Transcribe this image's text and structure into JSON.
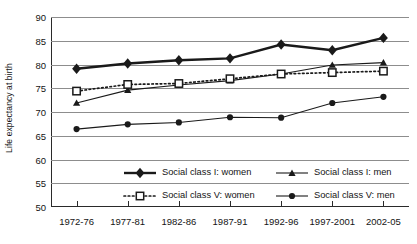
{
  "chart_data": {
    "type": "line",
    "title": "",
    "xlabel": "",
    "ylabel": "Life expectancy at birth",
    "categories": [
      "1972-76",
      "1977-81",
      "1982-86",
      "1987-91",
      "1992-96",
      "1997-2001",
      "2002-05"
    ],
    "ylim": [
      50,
      90
    ],
    "ytick_labels": [
      "90",
      "85",
      "80",
      "75",
      "70",
      "65",
      "60",
      "55",
      "50"
    ],
    "ytick_values": [
      90,
      85,
      80,
      75,
      70,
      65,
      60,
      55,
      50
    ],
    "grid": true,
    "legend_position": "inside-lower-center",
    "series": [
      {
        "name": "Social class I: women",
        "marker": "filled-diamond",
        "line": "solid-thick",
        "color": "#1a1a1a",
        "values": [
          79.1,
          80.2,
          80.9,
          81.3,
          84.2,
          83.0,
          85.6
        ]
      },
      {
        "name": "Social class I: men",
        "marker": "filled-triangle",
        "line": "solid-thin",
        "color": "#1a1a1a",
        "values": [
          71.9,
          74.6,
          75.7,
          76.6,
          78.0,
          79.9,
          80.4
        ]
      },
      {
        "name": "Social class V: women",
        "marker": "open-square",
        "line": "dotted",
        "color": "#1a1a1a",
        "values": [
          74.4,
          75.8,
          76.0,
          77.0,
          78.0,
          78.3,
          78.6
        ]
      },
      {
        "name": "Social class V: men",
        "marker": "filled-circle",
        "line": "solid-thin",
        "color": "#1a1a1a",
        "values": [
          66.4,
          67.4,
          67.8,
          68.9,
          68.8,
          71.9,
          73.2
        ]
      }
    ]
  },
  "legend": {
    "items": [
      {
        "label": "Social class I: women",
        "series_index": 0
      },
      {
        "label": "Social class I: men",
        "series_index": 1
      },
      {
        "label": "Social class V: women",
        "series_index": 2
      },
      {
        "label": "Social class V: men",
        "series_index": 3
      }
    ]
  }
}
